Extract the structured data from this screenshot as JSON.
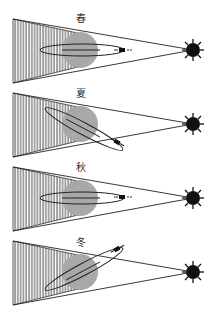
{
  "diagram": {
    "type": "seasonal satellite orbit vs. sun illumination / Earth shadow",
    "colors": {
      "earth": "#a8a8a8",
      "lines": "#222222",
      "sun": "#111111",
      "shadow_hatch": "#333333",
      "background": "#ffffff"
    },
    "panels": [
      {
        "id": "spring",
        "label": "春",
        "orbit_tilt_deg": 0,
        "cy": 50
      },
      {
        "id": "summer",
        "label": "夏",
        "orbit_tilt_deg": 28,
        "cy": 124
      },
      {
        "id": "autumn",
        "label": "秋",
        "orbit_tilt_deg": 0,
        "cy": 198
      },
      {
        "id": "winter",
        "label": "冬",
        "orbit_tilt_deg": -28,
        "cy": 272
      }
    ],
    "elements": {
      "sun": "sun-icon",
      "earth": "earth-disc",
      "shadow": "hatched-shadow-wedge",
      "orbit": "orbit-ellipse",
      "satellite": "satellite-icon"
    }
  }
}
